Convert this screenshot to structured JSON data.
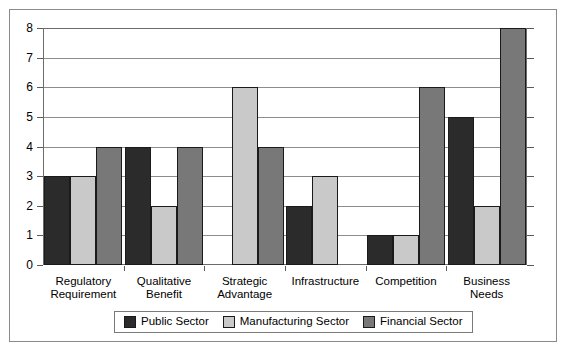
{
  "chart_data": {
    "type": "bar",
    "title": "",
    "subtitle": "",
    "xlabel": "",
    "ylabel": "",
    "ylim": [
      0,
      8
    ],
    "yticks": [
      0,
      1,
      2,
      3,
      4,
      5,
      6,
      7,
      8
    ],
    "ytick_labels": [
      "0",
      "1",
      "2",
      "3",
      "4",
      "5",
      "6",
      "7",
      "8"
    ],
    "grid": true,
    "legend_position": "bottom",
    "categories": [
      "Regulatory\nRequirement",
      "Qualitative\nBenefit",
      "Strategic\nAdvantage",
      "Infrastructure",
      "Competition",
      "Business Needs"
    ],
    "series": [
      {
        "name": "Public Sector",
        "color": "#2b2b2b",
        "values": [
          3,
          4,
          0,
          2,
          1,
          5
        ]
      },
      {
        "name": "Manufacturing Sector",
        "color": "#c9c9c9",
        "values": [
          3,
          2,
          6,
          3,
          1,
          2
        ]
      },
      {
        "name": "Financial Sector",
        "color": "#787878",
        "values": [
          4,
          4,
          4,
          0,
          6,
          8
        ]
      }
    ]
  },
  "legend": {
    "entries": [
      {
        "label": "Public Sector",
        "color": "#2b2b2b"
      },
      {
        "label": "Manufacturing Sector",
        "color": "#c9c9c9"
      },
      {
        "label": "Financial Sector",
        "color": "#787878"
      }
    ]
  },
  "colors": {
    "background": "#ffffff",
    "frame": "#8a8a8a",
    "axis": "#6b6b6b",
    "gridline": "#8d8d8d",
    "bar_outline": "#1a1a1a"
  }
}
